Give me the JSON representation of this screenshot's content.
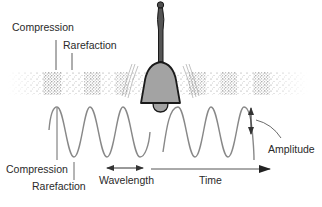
{
  "diagram": {
    "labels": {
      "top_compression": "Compression",
      "top_rarefaction": "Rarefaction",
      "bottom_compression": "Compression",
      "bottom_rarefaction": "Rarefaction",
      "wavelength": "Wavelength",
      "time": "Time",
      "amplitude": "Amplitude"
    },
    "colors": {
      "bell_body": "#a3a3a3",
      "bell_handle": "#555555",
      "outline": "#1a1a1a",
      "wave_line": "#8a8a8a",
      "stipple": "#6a6a6a",
      "text": "#2a2a2a"
    },
    "elements": {
      "bell": "hand bell with handle, body and clapper",
      "air_band": "stippled band showing alternating compression and rarefaction zones",
      "waveform": "sinusoidal wave split by the bell into left and right segments",
      "wavelength_arrow": "double-headed arrow spanning one wavelength",
      "time_arrow": "right-pointing arrow indicating time axis",
      "amplitude_arrow": "double-headed vertical arrow at wave crest"
    }
  }
}
